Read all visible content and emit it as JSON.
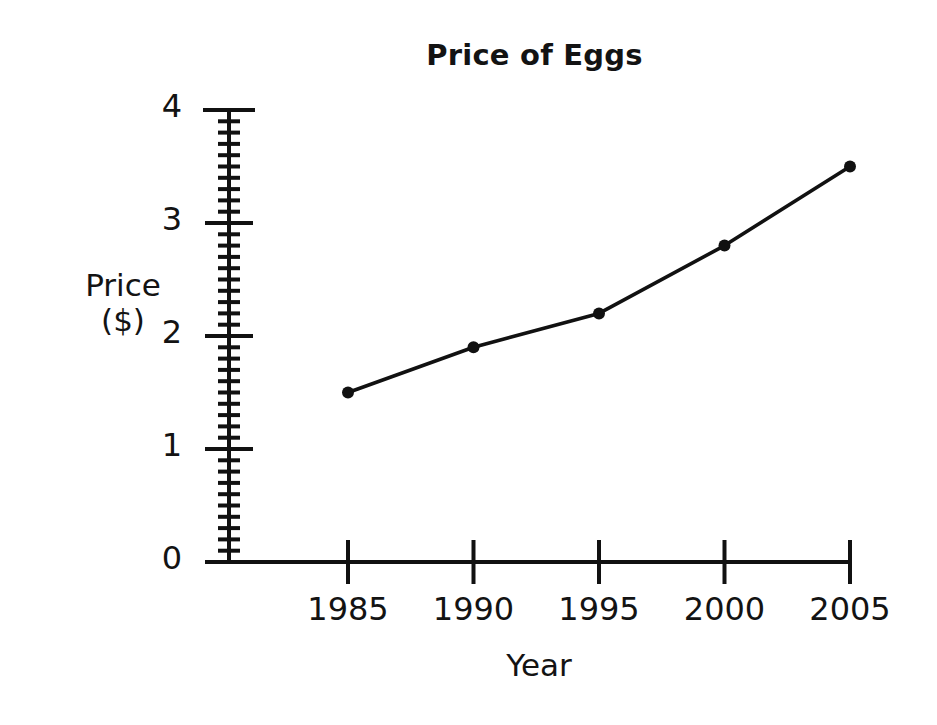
{
  "chart_data": {
    "type": "line",
    "title": "Price of Eggs",
    "xlabel": "Year",
    "ylabel": "Price ($)",
    "ylabel_lines": [
      "Price",
      "($)"
    ],
    "categories": [
      "1985",
      "1990",
      "1995",
      "2000",
      "2005"
    ],
    "x": [
      1985,
      1990,
      1995,
      2000,
      2005
    ],
    "values": [
      1.5,
      1.9,
      2.2,
      2.8,
      3.5
    ],
    "series": [
      {
        "name": "Price of Eggs",
        "values": [
          1.5,
          1.9,
          2.2,
          2.8,
          3.5
        ]
      }
    ],
    "xtick_labels": [
      "1985",
      "1990",
      "1995",
      "2000",
      "2005"
    ],
    "ytick_labels": [
      "0",
      "1",
      "2",
      "3",
      "4"
    ],
    "ytick_values": [
      0,
      1,
      2,
      3,
      4
    ],
    "ylim": [
      0,
      4
    ],
    "xlim": [
      1985,
      2005
    ],
    "y_minor_tick_interval": 0.1,
    "y_major_tick_interval": 1,
    "grid": false,
    "legend": false,
    "legend_position": "none",
    "line_color": "#111111",
    "marker_color": "#111111",
    "marker_shape": "circle",
    "axis_color": "#111111",
    "background_color": "#ffffff"
  },
  "title": {
    "text": "Price of Eggs"
  },
  "axes": {
    "y": {
      "label_line1": "Price",
      "label_line2": "($)",
      "ticks": [
        {
          "label": "4",
          "value": 4
        },
        {
          "label": "3",
          "value": 3
        },
        {
          "label": "2",
          "value": 2
        },
        {
          "label": "1",
          "value": 1
        },
        {
          "label": "0",
          "value": 0
        }
      ]
    },
    "x": {
      "label": "Year",
      "ticks": [
        {
          "label": "1985",
          "value": 1985
        },
        {
          "label": "1990",
          "value": 1990
        },
        {
          "label": "1995",
          "value": 1995
        },
        {
          "label": "2000",
          "value": 2000
        },
        {
          "label": "2005",
          "value": 2005
        }
      ]
    }
  },
  "points": [
    {
      "x": "1985",
      "y": "1.5"
    },
    {
      "x": "1990",
      "y": "1.9"
    },
    {
      "x": "1995",
      "y": "2.2"
    },
    {
      "x": "2000",
      "y": "2.8"
    },
    {
      "x": "2005",
      "y": "3.5"
    }
  ]
}
